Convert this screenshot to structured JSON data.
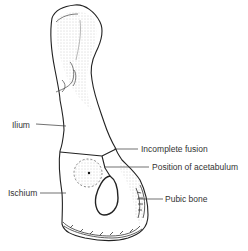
{
  "figure": {
    "colors": {
      "ink": "#222222",
      "stipple": "#9a9a9a",
      "label": "#333333",
      "background": "#ffffff"
    },
    "labels": [
      {
        "id": "ilium",
        "text": "Ilium",
        "x": 12,
        "y": 120
      },
      {
        "id": "incomplete-fusion",
        "text": "Incomplete fusion",
        "x": 141,
        "y": 144
      },
      {
        "id": "acetabulum",
        "text": "Position of acetabulum",
        "x": 152,
        "y": 162
      },
      {
        "id": "ischium",
        "text": "Ischium",
        "x": 8,
        "y": 188
      },
      {
        "id": "pubic-bone",
        "text": "Pubic bone",
        "x": 165,
        "y": 194
      }
    ]
  }
}
